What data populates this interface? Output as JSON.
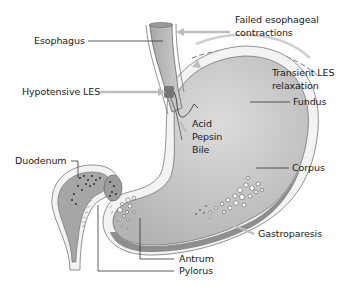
{
  "diagram": {
    "labels": {
      "esophagus": "Esophagus",
      "failed_contractions_line1": "Failed esophageal",
      "failed_contractions_line2": "contractions",
      "hypotensive_les": "Hypotensive LES",
      "transient_les_line1": "Transient LES",
      "transient_les_line2": "relaxation",
      "fundus": "Fundus",
      "acid": "Acid",
      "pepsin": "Pepsin",
      "bile": "Bile",
      "duodenum": "Duodenum",
      "corpus": "Corpus",
      "gastroparesis": "Gastroparesis",
      "antrum": "Antrum",
      "pylorus": "Pylorus"
    },
    "colors": {
      "stomach_fill": "#c8c8c8",
      "stomach_wall": "#f2f2f2",
      "dark_wall": "#8c8c8c",
      "leader_line": "#333333",
      "arrow_gray": "#bdbdbd",
      "text": "#1a1a1a"
    }
  }
}
